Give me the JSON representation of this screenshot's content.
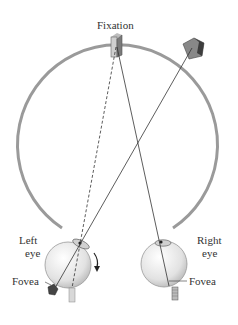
{
  "labels": {
    "fixation": "Fixation",
    "left_eye_line1": "Left",
    "left_eye_line2": "eye",
    "right_eye_line1": "Right",
    "right_eye_line2": "eye",
    "fovea_left": "Fovea",
    "fovea_right": "Fovea"
  },
  "colors": {
    "arc": "#9a9a9a",
    "eye_fill": "#e6e6e6",
    "line": "#333333",
    "object_dark": "#555555"
  }
}
